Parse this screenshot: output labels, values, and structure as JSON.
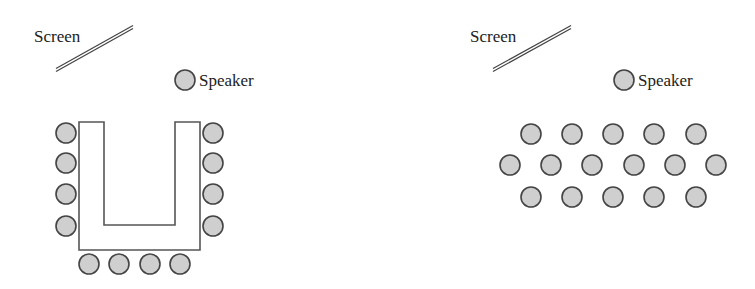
{
  "diagrams": [
    {
      "name": "u-shape-layout",
      "screen_label": "Screen",
      "speaker_label": "Speaker",
      "screen_label_pos": [
        34,
        42
      ],
      "screen_line": [
        56,
        70,
        133,
        27
      ],
      "speaker": [
        185,
        80
      ],
      "speaker_label_pos": [
        199,
        86
      ],
      "table_path": "M79,122 L104,122 L104,225 L175,225 L175,122 L200,122 L200,250 L79,250 Z",
      "seats": [
        [
          66,
          133
        ],
        [
          66,
          163
        ],
        [
          66,
          194
        ],
        [
          66,
          226
        ],
        [
          213,
          133
        ],
        [
          213,
          163
        ],
        [
          213,
          194
        ],
        [
          213,
          226
        ],
        [
          89,
          264
        ],
        [
          119,
          264
        ],
        [
          150,
          264
        ],
        [
          180,
          264
        ]
      ]
    },
    {
      "name": "classroom-layout",
      "screen_label": "Screen",
      "speaker_label": "Speaker",
      "screen_label_pos": [
        470,
        42
      ],
      "screen_line": [
        493,
        70,
        571,
        27
      ],
      "speaker": [
        624,
        80
      ],
      "speaker_label_pos": [
        638,
        86
      ],
      "seats": [
        [
          531,
          134
        ],
        [
          572,
          134
        ],
        [
          613,
          134
        ],
        [
          654,
          134
        ],
        [
          696,
          134
        ],
        [
          510,
          165
        ],
        [
          551,
          165
        ],
        [
          592,
          165
        ],
        [
          634,
          165
        ],
        [
          675,
          165
        ],
        [
          716,
          165
        ],
        [
          531,
          197
        ],
        [
          572,
          197
        ],
        [
          613,
          197
        ],
        [
          654,
          197
        ],
        [
          696,
          197
        ]
      ]
    }
  ],
  "seat_radius": 10,
  "colors": {
    "seat_fill": "#cfcfcf",
    "stroke": "#444444",
    "background": "#ffffff"
  }
}
